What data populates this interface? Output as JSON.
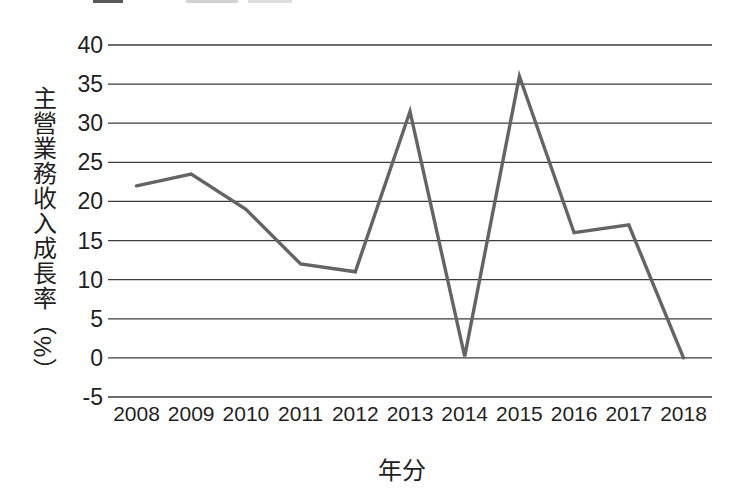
{
  "figure": {
    "background_color": "#ffffff",
    "text_color": "#1f1f1f",
    "gridline_color": "#3d3d3d",
    "line_color": "#646464"
  },
  "chart_data": {
    "type": "line",
    "title": "",
    "xlabel": "年分",
    "ylabel": "主營業務收入成長率（%）",
    "x": [
      "2008",
      "2009",
      "2010",
      "2011",
      "2012",
      "2013",
      "2014",
      "2015",
      "2016",
      "2017",
      "2018"
    ],
    "values": [
      22,
      23.5,
      19,
      12,
      11,
      31.5,
      0.2,
      36,
      16,
      17,
      0
    ],
    "ylim": [
      -5,
      40
    ],
    "yticks": [
      40,
      35,
      30,
      25,
      20,
      15,
      10,
      5,
      0,
      -5
    ],
    "grid": "horizontal",
    "legend": "none"
  }
}
